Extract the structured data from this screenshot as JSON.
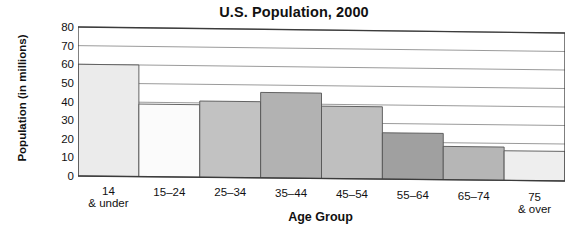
{
  "chart_data": {
    "type": "bar",
    "title": "U.S. Population, 2000",
    "xlabel": "Age Group",
    "ylabel": "Population (in millions)",
    "categories": [
      "14 & under",
      "15–24",
      "25–34",
      "35–44",
      "45–54",
      "55–64",
      "65–74",
      "75 & over"
    ],
    "category_lines": [
      {
        "line1": "14",
        "line2": "& under"
      },
      {
        "line1": "15–24",
        "line2": ""
      },
      {
        "line1": "25–34",
        "line2": ""
      },
      {
        "line1": "35–44",
        "line2": ""
      },
      {
        "line1": "45–54",
        "line2": ""
      },
      {
        "line1": "55–64",
        "line2": ""
      },
      {
        "line1": "65–74",
        "line2": ""
      },
      {
        "line1": "75",
        "line2": "& over"
      }
    ],
    "values": [
      60,
      39,
      41,
      46,
      39,
      25,
      18,
      16
    ],
    "bar_colors": [
      "#ebebeb",
      "#fbfbfb",
      "#c2c2c2",
      "#b2b2b2",
      "#bfbfbf",
      "#a0a0a0",
      "#b6b6b6",
      "#eeeeee"
    ],
    "ylim": [
      0,
      80
    ],
    "ytick_values": [
      80,
      70,
      60,
      50,
      40,
      30,
      20,
      10,
      0
    ],
    "ytick_labels": [
      "80",
      "70",
      "60",
      "50",
      "40",
      "30",
      "20",
      "10",
      "0"
    ],
    "grid": true,
    "legend": "none",
    "axis_line_color": "#3b3b3b",
    "grid_color": "#8f8f8f",
    "bar_edge_color": "#555555"
  }
}
